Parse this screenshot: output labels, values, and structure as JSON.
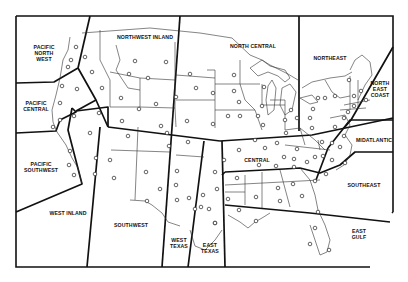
{
  "map": {
    "title": "US Forecast Regions",
    "colors": {
      "line": "#111111",
      "background": "#ffffff",
      "station": "#222222"
    },
    "regions": [
      {
        "id": "pacific-north-west",
        "label": "PACIFIC\nNORTH\nWEST",
        "x": 44,
        "y": 53
      },
      {
        "id": "northwest-inland",
        "label": "NORTHWEST INLAND",
        "x": 145,
        "y": 37
      },
      {
        "id": "north-central",
        "label": "NORTH CENTRAL",
        "x": 253,
        "y": 46
      },
      {
        "id": "northeast",
        "label": "NORTHEAST",
        "x": 330,
        "y": 58
      },
      {
        "id": "north-east-coast",
        "label": "NORTH\nEAST\nCOAST",
        "x": 380,
        "y": 89
      },
      {
        "id": "pacific-central",
        "label": "PACIFIC\nCENTRAL",
        "x": 36,
        "y": 106
      },
      {
        "id": "midatlantic",
        "label": "MIDATLANTIC",
        "x": 374,
        "y": 140
      },
      {
        "id": "central",
        "label": "CENTRAL",
        "x": 257,
        "y": 160
      },
      {
        "id": "pacific-southwest",
        "label": "PACIFIC\nSOUTHWEST",
        "x": 41,
        "y": 167
      },
      {
        "id": "southeast",
        "label": "SOUTHEAST",
        "x": 364,
        "y": 185
      },
      {
        "id": "west-inland",
        "label": "WEST INLAND",
        "x": 68,
        "y": 213
      },
      {
        "id": "southwest",
        "label": "SOUTHWEST",
        "x": 131,
        "y": 225
      },
      {
        "id": "east-gulf",
        "label": "EAST\nGULF",
        "x": 359,
        "y": 234
      },
      {
        "id": "west-texas",
        "label": "WEST\nTEXAS",
        "x": 179,
        "y": 243
      },
      {
        "id": "east-texas",
        "label": "EAST\nTEXAS",
        "x": 210,
        "y": 248
      }
    ]
  }
}
